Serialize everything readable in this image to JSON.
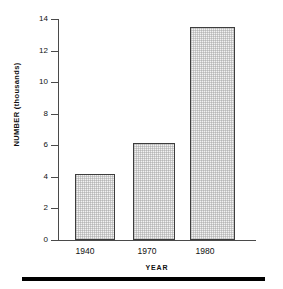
{
  "chart_data": {
    "type": "bar",
    "title": "",
    "xlabel": "YEAR",
    "ylabel": "NUMBER (thousands)",
    "categories": [
      "1940",
      "1970",
      "1980"
    ],
    "values": [
      4.2,
      6.15,
      13.5
    ],
    "ylim": [
      0,
      14
    ],
    "yticks": [
      "0",
      "2",
      "4",
      "6",
      "8",
      "10",
      "12",
      "14"
    ],
    "ytick_values": [
      0,
      2,
      4,
      6,
      8,
      10,
      12,
      14
    ],
    "grid": false,
    "legend": "none",
    "bar_fill_color": "#f2f2f2",
    "bar_edge_color": "#3d3d3d",
    "axis_color": "#4a4a4a",
    "background_color": "#ffffff"
  },
  "figure": {
    "bottom_rule_color": "#000000"
  }
}
